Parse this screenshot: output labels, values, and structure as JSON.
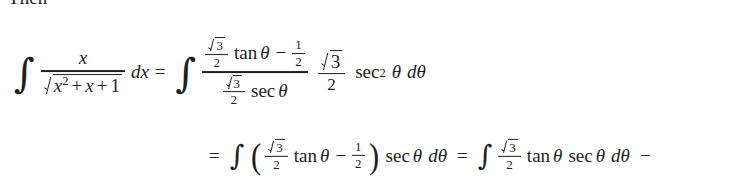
{
  "document": {
    "intro_text": "Then",
    "text_color": "#201f20",
    "background_color": "#ffffff"
  },
  "symbols": {
    "integral": "∫",
    "equals": "=",
    "minus": "−",
    "theta": "θ",
    "paren_open": "(",
    "paren_close": ")",
    "three": "3",
    "two": "2",
    "one": "1",
    "exp_two": "2",
    "d": "d",
    "x": "x",
    "plus": "+",
    "tan": "tan",
    "sec": "sec"
  },
  "equation_line_1": {
    "id": "eq-line-1",
    "latex": "\\int \\frac{x}{\\sqrt{x^2+x+1}}\\,dx = \\int \\frac{\\frac{\\sqrt3}{2}\\tan\\theta-\\frac12}{\\frac{\\sqrt3}{2}\\sec\\theta}\\;\\frac{\\sqrt3}{2}\\;\\sec^2\\theta\\,d\\theta",
    "lhs": {
      "integral": "∫",
      "numerator": "x",
      "denominator_radicand": "x² + x + 1",
      "differential": "dx"
    },
    "relation": "=",
    "rhs": {
      "integral": "∫",
      "fraction_numerator": "√3/2 tan θ − 1/2",
      "fraction_denominator": "√3/2 sec θ",
      "coefficient": "√3/2",
      "trig_term": "sec² θ",
      "differential": "dθ"
    }
  },
  "equation_line_2": {
    "id": "eq-line-2",
    "latex": "= \\int\\left(\\frac{\\sqrt3}{2}\\tan\\theta-\\frac12\\right)\\sec\\theta\\,d\\theta = \\int\\frac{\\sqrt3}{2}\\tan\\theta\\,\\sec\\theta\\,d\\theta -",
    "relation_leading": "=",
    "first_integral": "∫",
    "grouped_expression": "(√3/2 tan θ − 1/2)",
    "trailing_factor": "sec θ dθ",
    "relation_middle": "=",
    "second_integral": "∫",
    "second_expression": "√3/2 tan θ sec θ dθ",
    "trailing_operator": "−",
    "note": "line continues past right edge of view"
  }
}
